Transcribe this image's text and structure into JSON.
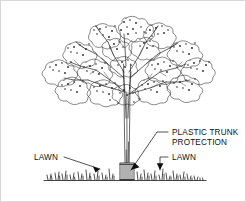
{
  "drawing": {
    "title": "Tree with plastic trunk protection — landscape detail",
    "background_color": "#ffffff",
    "line_color": "#1a1a1a",
    "border_color": "#d8d8d8"
  },
  "callouts": {
    "lawn_left": {
      "label": "LAWN",
      "text_x": 34,
      "text_y": 160,
      "leader_path": "M 64 157 L 100 169",
      "arrow_points": "100,169 93,166.5 95.5,172.5"
    },
    "plastic_trunk_protection": {
      "line1": "PLASTIC TRUNK",
      "line2": "PROTECTION",
      "text_x": 172,
      "text_y": 135,
      "line2_y": 145,
      "leader_path": "M 168 132 L 157 132 L 131 170",
      "arrow_points": "131,170 134.5,162.8 139.5,167.2"
    },
    "lawn_right": {
      "label": "LAWN",
      "text_x": 172,
      "text_y": 160,
      "leader_path": "M 168 157 L 160 157 L 160 170",
      "arrow_points": "160,170 156.8,163.2 163.4,163.2"
    }
  },
  "scene": {
    "ground_line": {
      "name": "ground-line",
      "x_start": 44,
      "x_end": 206,
      "y": 180
    },
    "trunk": {
      "name": "tree-trunk",
      "base_x": 127,
      "base_y": 180,
      "top_y": 62
    },
    "canopy": {
      "name": "tree-canopy",
      "center_x": 125,
      "center_y": 62,
      "width": 134,
      "height": 104
    },
    "trunk_protection": {
      "name": "plastic-trunk-protection",
      "x": 120,
      "y": 163,
      "width": 14,
      "height": 17,
      "slat_count": 6
    },
    "grass_tufts_left_count": 17,
    "grass_tufts_right_count": 19
  }
}
